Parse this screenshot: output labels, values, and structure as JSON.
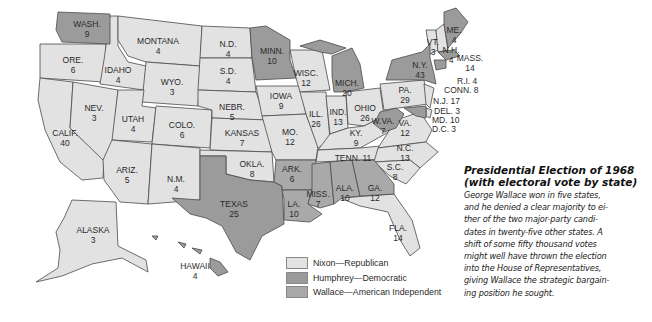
{
  "colors": {
    "nixon": "#e2e2e2",
    "humphrey": "#9b9b9b",
    "wallace": "#a9a9a9",
    "border": "#4a4a4a",
    "background": "#ffffff"
  },
  "caption": {
    "title_line1": "Presidential Election of 1968",
    "title_line2": "(with electoral vote by state)",
    "body_lines": [
      "George Wallace won in five states,",
      "and he denied a clear majority to ei-",
      "ther of the two major-party candi-",
      "dates in twenty-five other states. A",
      "shift of some fifty thousand votes",
      "might well have thrown the election",
      "into the House of Representatives,",
      "giving Wallace the strategic bargain-",
      "ing position he sought."
    ]
  },
  "legend": [
    {
      "label": "Nixon—Republican",
      "party": "nixon"
    },
    {
      "label": "Humphrey—Democratic",
      "party": "humphrey"
    },
    {
      "label": "Wallace—American Independent",
      "party": "wallace"
    }
  ],
  "states": [
    {
      "name": "WASH.",
      "votes": "9",
      "winner": "humphrey"
    },
    {
      "name": "ORE.",
      "votes": "6",
      "winner": "nixon"
    },
    {
      "name": "CALIF.",
      "votes": "40",
      "winner": "nixon"
    },
    {
      "name": "IDAHO",
      "votes": "4",
      "winner": "nixon"
    },
    {
      "name": "NEV.",
      "votes": "3",
      "winner": "nixon"
    },
    {
      "name": "MONTANA",
      "votes": "4",
      "winner": "nixon"
    },
    {
      "name": "WYO.",
      "votes": "3",
      "winner": "nixon"
    },
    {
      "name": "UTAH",
      "votes": "4",
      "winner": "nixon"
    },
    {
      "name": "COLO.",
      "votes": "6",
      "winner": "nixon"
    },
    {
      "name": "ARIZ.",
      "votes": "5",
      "winner": "nixon"
    },
    {
      "name": "N.M.",
      "votes": "4",
      "winner": "nixon"
    },
    {
      "name": "N.D.",
      "votes": "4",
      "winner": "nixon"
    },
    {
      "name": "S.D.",
      "votes": "4",
      "winner": "nixon"
    },
    {
      "name": "NEBR.",
      "votes": "5",
      "winner": "nixon"
    },
    {
      "name": "KANSAS",
      "votes": "7",
      "winner": "nixon"
    },
    {
      "name": "OKLA.",
      "votes": "8",
      "winner": "nixon"
    },
    {
      "name": "TEXAS",
      "votes": "25",
      "winner": "humphrey"
    },
    {
      "name": "MINN.",
      "votes": "10",
      "winner": "humphrey"
    },
    {
      "name": "IOWA",
      "votes": "9",
      "winner": "nixon"
    },
    {
      "name": "MO.",
      "votes": "12",
      "winner": "nixon"
    },
    {
      "name": "ARK.",
      "votes": "6",
      "winner": "wallace"
    },
    {
      "name": "LA.",
      "votes": "10",
      "winner": "wallace"
    },
    {
      "name": "WISC.",
      "votes": "12",
      "winner": "nixon"
    },
    {
      "name": "ILL.",
      "votes": "26",
      "winner": "nixon"
    },
    {
      "name": "MICH.",
      "votes": "20",
      "winner": "humphrey"
    },
    {
      "name": "IND.",
      "votes": "13",
      "winner": "nixon"
    },
    {
      "name": "OHIO",
      "votes": "26",
      "winner": "nixon"
    },
    {
      "name": "KY.",
      "votes": "9",
      "winner": "nixon"
    },
    {
      "name": "TENN.",
      "votes": "11",
      "winner": "nixon"
    },
    {
      "name": "MISS.",
      "votes": "7",
      "winner": "wallace"
    },
    {
      "name": "ALA.",
      "votes": "10",
      "winner": "wallace"
    },
    {
      "name": "GA.",
      "votes": "12",
      "winner": "wallace"
    },
    {
      "name": "FLA.",
      "votes": "14",
      "winner": "nixon"
    },
    {
      "name": "S.C.",
      "votes": "8",
      "winner": "nixon"
    },
    {
      "name": "N.C.",
      "votes": "13",
      "winner": "nixon"
    },
    {
      "name": "VA.",
      "votes": "12",
      "winner": "nixon"
    },
    {
      "name": "W.VA.",
      "votes": "7",
      "winner": "humphrey"
    },
    {
      "name": "PA.",
      "votes": "29",
      "winner": "humphrey"
    },
    {
      "name": "N.Y.",
      "votes": "43",
      "winner": "humphrey"
    },
    {
      "name": "VT.",
      "votes": "3",
      "winner": "nixon"
    },
    {
      "name": "N.H.",
      "votes": "4",
      "winner": "nixon"
    },
    {
      "name": "ME.",
      "votes": "4",
      "winner": "humphrey"
    },
    {
      "name": "MASS.",
      "votes": "14",
      "winner": "humphrey"
    },
    {
      "name": "R.I.",
      "votes": "4",
      "winner": "humphrey"
    },
    {
      "name": "CONN.",
      "votes": "8",
      "winner": "humphrey"
    },
    {
      "name": "N.J.",
      "votes": "17",
      "winner": "nixon"
    },
    {
      "name": "DEL.",
      "votes": "3",
      "winner": "nixon"
    },
    {
      "name": "MD.",
      "votes": "10",
      "winner": "humphrey"
    },
    {
      "name": "D.C.",
      "votes": "3",
      "winner": "humphrey"
    },
    {
      "name": "ALASKA",
      "votes": "3",
      "winner": "nixon"
    },
    {
      "name": "HAWAII",
      "votes": "4",
      "winner": "humphrey"
    }
  ],
  "labels": {
    "wash": "WASH.\n9",
    "ore": "ORE.\n6",
    "calif": "CALIF.\n40",
    "idaho": "IDAHO\n4",
    "nev": "NEV.\n3",
    "montana": "MONTANA\n4",
    "wyo": "WYO.\n3",
    "utah": "UTAH\n4",
    "colo": "COLO.\n6",
    "ariz": "ARIZ.\n5",
    "nm": "N.M.\n4",
    "nd": "N.D.\n4",
    "sd": "S.D.\n4",
    "nebr": "NEBR.\n5",
    "kansas": "KANSAS\n7",
    "okla": "OKLA.\n8",
    "texas": "TEXAS\n25",
    "minn": "MINN.\n10",
    "iowa": "IOWA\n9",
    "mo": "MO.\n12",
    "ark": "ARK.\n6",
    "la": "LA.\n10",
    "wisc": "WISC.\n12",
    "ill": "ILL.\n26",
    "mich": "MICH.\n20",
    "ind": "IND.\n13",
    "ohio": "OHIO\n26",
    "ky": "KY.\n9",
    "tenn": "TENN. 11",
    "miss": "MISS.\n7",
    "ala": "ALA.\n10",
    "ga": "GA.\n12",
    "fla": "FLA.\n14",
    "sc": "S.C.\n8",
    "nc": "N.C.\n13",
    "va": "VA.\n12",
    "wva": "W.VA.\n7",
    "pa": "PA.\n29",
    "ny": "N.Y.\n43",
    "vt": "VT.\n3",
    "nh": "N.H.\n4",
    "me": "ME.\n4",
    "mass": "MASS.\n14",
    "ri": "R.I. 4",
    "conn": "CONN. 8",
    "nj": "N.J. 17",
    "del": "DEL. 3",
    "md": "MD. 10",
    "dc": "D.C. 3",
    "alaska": "ALASKA\n3",
    "hawaii": "HAWAII\n4"
  }
}
